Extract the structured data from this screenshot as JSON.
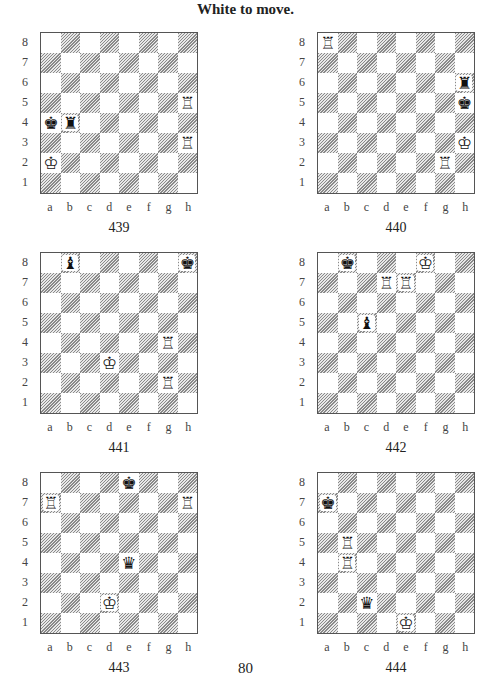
{
  "title": "White to move.",
  "page_number": "80",
  "files": [
    "a",
    "b",
    "c",
    "d",
    "e",
    "f",
    "g",
    "h"
  ],
  "ranks": [
    "8",
    "7",
    "6",
    "5",
    "4",
    "3",
    "2",
    "1"
  ],
  "diagrams": [
    {
      "number": "439",
      "x": 40,
      "y": 32,
      "pieces": [
        {
          "sq": "a4",
          "color": "black",
          "type": "king",
          "glyph": "♚"
        },
        {
          "sq": "b4",
          "color": "black",
          "type": "rook",
          "glyph": "♜"
        },
        {
          "sq": "h5",
          "color": "white",
          "type": "rook",
          "glyph": "♖"
        },
        {
          "sq": "h3",
          "color": "white",
          "type": "rook",
          "glyph": "♖"
        },
        {
          "sq": "a2",
          "color": "white",
          "type": "king",
          "glyph": "♔"
        }
      ]
    },
    {
      "number": "440",
      "x": 317,
      "y": 32,
      "pieces": [
        {
          "sq": "a8",
          "color": "white",
          "type": "rook",
          "glyph": "♖"
        },
        {
          "sq": "h6",
          "color": "black",
          "type": "rook",
          "glyph": "♜"
        },
        {
          "sq": "h5",
          "color": "black",
          "type": "king",
          "glyph": "♚"
        },
        {
          "sq": "h3",
          "color": "white",
          "type": "king",
          "glyph": "♔"
        },
        {
          "sq": "g2",
          "color": "white",
          "type": "rook",
          "glyph": "♖"
        }
      ]
    },
    {
      "number": "441",
      "x": 40,
      "y": 252,
      "pieces": [
        {
          "sq": "b8",
          "color": "black",
          "type": "bishop",
          "glyph": "♝"
        },
        {
          "sq": "h8",
          "color": "black",
          "type": "king",
          "glyph": "♚"
        },
        {
          "sq": "g4",
          "color": "white",
          "type": "rook",
          "glyph": "♖"
        },
        {
          "sq": "d3",
          "color": "white",
          "type": "king",
          "glyph": "♔"
        },
        {
          "sq": "g2",
          "color": "white",
          "type": "rook",
          "glyph": "♖"
        }
      ]
    },
    {
      "number": "442",
      "x": 317,
      "y": 252,
      "pieces": [
        {
          "sq": "b8",
          "color": "black",
          "type": "king",
          "glyph": "♚"
        },
        {
          "sq": "f8",
          "color": "white",
          "type": "king",
          "glyph": "♔"
        },
        {
          "sq": "d7",
          "color": "white",
          "type": "rook",
          "glyph": "♖"
        },
        {
          "sq": "e7",
          "color": "white",
          "type": "rook",
          "glyph": "♖"
        },
        {
          "sq": "c5",
          "color": "black",
          "type": "bishop",
          "glyph": "♝"
        }
      ]
    },
    {
      "number": "443",
      "x": 40,
      "y": 472,
      "pieces": [
        {
          "sq": "e8",
          "color": "black",
          "type": "king",
          "glyph": "♚"
        },
        {
          "sq": "a7",
          "color": "white",
          "type": "rook",
          "glyph": "♖"
        },
        {
          "sq": "h7",
          "color": "white",
          "type": "rook",
          "glyph": "♖"
        },
        {
          "sq": "e4",
          "color": "black",
          "type": "queen",
          "glyph": "♛"
        },
        {
          "sq": "d2",
          "color": "white",
          "type": "king",
          "glyph": "♔"
        }
      ]
    },
    {
      "number": "444",
      "x": 317,
      "y": 472,
      "pieces": [
        {
          "sq": "a7",
          "color": "black",
          "type": "king",
          "glyph": "♚"
        },
        {
          "sq": "b5",
          "color": "white",
          "type": "rook",
          "glyph": "♖"
        },
        {
          "sq": "b4",
          "color": "white",
          "type": "rook",
          "glyph": "♖"
        },
        {
          "sq": "c2",
          "color": "black",
          "type": "queen",
          "glyph": "♛"
        },
        {
          "sq": "e1",
          "color": "white",
          "type": "king",
          "glyph": "♔"
        }
      ]
    }
  ]
}
